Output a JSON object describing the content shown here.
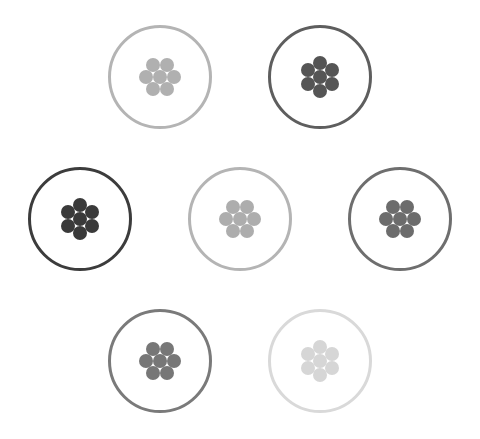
{
  "board": {
    "label": "Hexagonal tile puzzle",
    "cells": [
      {
        "id": "cell-1",
        "label": "Tile 1",
        "cx": 160,
        "cy": 77,
        "ring_color": "#b4b4b4",
        "dot_color": "#b0b0b0",
        "orientation": "flat"
      },
      {
        "id": "cell-2",
        "label": "Tile 2",
        "cx": 320,
        "cy": 77,
        "ring_color": "#5e5e5e",
        "dot_color": "#555555",
        "orientation": "pointy"
      },
      {
        "id": "cell-3",
        "label": "Tile 3",
        "cx": 80,
        "cy": 219,
        "ring_color": "#3c3c3c",
        "dot_color": "#3a3a3a",
        "orientation": "pointy"
      },
      {
        "id": "cell-4",
        "label": "Tile 4",
        "cx": 240,
        "cy": 219,
        "ring_color": "#b4b4b4",
        "dot_color": "#adadad",
        "orientation": "flat"
      },
      {
        "id": "cell-5",
        "label": "Tile 5",
        "cx": 400,
        "cy": 219,
        "ring_color": "#6e6e6e",
        "dot_color": "#6c6c6c",
        "orientation": "flat"
      },
      {
        "id": "cell-6",
        "label": "Tile 6",
        "cx": 160,
        "cy": 361,
        "ring_color": "#7a7a7a",
        "dot_color": "#777777",
        "orientation": "flat"
      },
      {
        "id": "cell-7",
        "label": "Tile 7",
        "cx": 320,
        "cy": 361,
        "ring_color": "#d9d9d9",
        "dot_color": "#d6d6d6",
        "orientation": "pointy"
      }
    ],
    "dots_per_cell": 7,
    "icon": "hexagonal-dot-cluster-icon"
  }
}
